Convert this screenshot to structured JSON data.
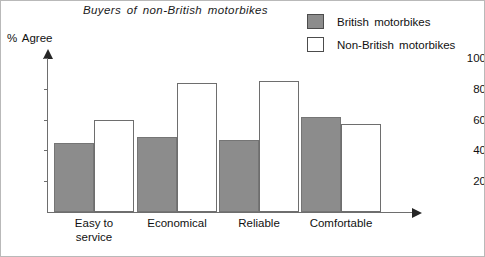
{
  "chart_data": {
    "type": "bar",
    "title": "Buyers of non-British motorbikes",
    "xlabel": "",
    "ylabel": "% Agree",
    "ylim": [
      0,
      100
    ],
    "yticks": [
      20,
      40,
      60,
      80,
      100
    ],
    "grid": false,
    "legend_position": "top-right",
    "categories": [
      "Easy to\nservice",
      "Economical",
      "Reliable",
      "Comfortable"
    ],
    "series": [
      {
        "name": "British motorbikes",
        "color": "#8c8c8c",
        "values": [
          45,
          49,
          47,
          62
        ]
      },
      {
        "name": "Non-British motorbikes",
        "color": "#ffffff",
        "values": [
          60,
          84,
          85,
          57
        ]
      }
    ]
  },
  "axis": {
    "y_title": "% Agree",
    "tick_labels": [
      "20",
      "40",
      "60",
      "80",
      "100"
    ]
  },
  "legend": {
    "items": [
      {
        "label": "British motorbikes",
        "swatch": "filled-square-icon"
      },
      {
        "label": "Non-British motorbikes",
        "swatch": "hollow-square-icon"
      }
    ]
  }
}
